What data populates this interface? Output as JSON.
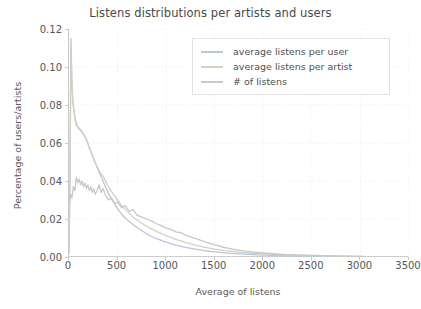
{
  "chart_data": {
    "type": "line",
    "title": "Listens distributions per artists and users",
    "xlabel": "Average of listens",
    "ylabel": "Percentage of users/artists",
    "xlim": [
      0,
      3500
    ],
    "ylim": [
      0.0,
      0.12
    ],
    "xticks": [
      0,
      500,
      1000,
      1500,
      2000,
      2500,
      3000,
      3500
    ],
    "xtick_labels": [
      "0",
      "500",
      "1000",
      "1500",
      "2000",
      "2500",
      "3000",
      "3500"
    ],
    "yticks": [
      0.0,
      0.02,
      0.04,
      0.06,
      0.08,
      0.1,
      0.12
    ],
    "ytick_labels": [
      "0.00",
      "0.02",
      "0.04",
      "0.06",
      "0.08",
      "0.10",
      "0.12"
    ],
    "grid": true,
    "grid_style": "dotted",
    "legend_position": "upper right",
    "series": [
      {
        "name": "average listens per user",
        "color": "#b9c6d8",
        "x": [
          0,
          10,
          20,
          30,
          40,
          55,
          70,
          85,
          100,
          120,
          140,
          160,
          180,
          200,
          230,
          260,
          290,
          320,
          350,
          400,
          450,
          500,
          550,
          600,
          650,
          700,
          750,
          800,
          850,
          900,
          1000,
          1100,
          1200,
          1300,
          1400,
          1500,
          1600,
          1700,
          1800,
          1900,
          2000,
          2200,
          2400,
          2600,
          2800,
          3000,
          3050
        ],
        "y": [
          0.002,
          0.04,
          0.115,
          0.092,
          0.082,
          0.076,
          0.071,
          0.069,
          0.068,
          0.067,
          0.0655,
          0.064,
          0.062,
          0.059,
          0.055,
          0.051,
          0.047,
          0.0435,
          0.04,
          0.034,
          0.0295,
          0.0255,
          0.022,
          0.0195,
          0.0175,
          0.0155,
          0.0138,
          0.0122,
          0.0108,
          0.0097,
          0.0078,
          0.0063,
          0.0051,
          0.0041,
          0.0033,
          0.0027,
          0.0022,
          0.0018,
          0.0015,
          0.0012,
          0.001,
          0.0007,
          0.0005,
          0.0004,
          0.0003,
          0.0002,
          0.0002
        ]
      },
      {
        "name": "average listens per artist",
        "color": "#cdd3c4",
        "x": [
          0,
          10,
          20,
          30,
          40,
          55,
          70,
          85,
          100,
          120,
          140,
          160,
          180,
          200,
          230,
          260,
          290,
          320,
          350,
          400,
          450,
          500,
          550,
          600,
          650,
          700,
          750,
          800,
          850,
          900,
          1000,
          1100,
          1200,
          1300,
          1400,
          1500,
          1600,
          1700,
          1800,
          1900,
          2000,
          2200,
          2400,
          2600,
          2800,
          3000,
          3050
        ],
        "y": [
          0.003,
          0.038,
          0.11,
          0.09,
          0.081,
          0.075,
          0.07,
          0.0685,
          0.0675,
          0.0665,
          0.065,
          0.0635,
          0.0615,
          0.0585,
          0.0545,
          0.0505,
          0.0475,
          0.0445,
          0.0425,
          0.0375,
          0.0335,
          0.03,
          0.0265,
          0.024,
          0.0215,
          0.0195,
          0.0178,
          0.0162,
          0.0148,
          0.0135,
          0.0112,
          0.0093,
          0.0077,
          0.0063,
          0.0051,
          0.0042,
          0.0034,
          0.0028,
          0.0023,
          0.0019,
          0.0016,
          0.0011,
          0.0008,
          0.0006,
          0.0004,
          0.0003,
          0.0002
        ]
      },
      {
        "name": "# of listens",
        "color": "#c8c8c8",
        "x": [
          0,
          15,
          30,
          45,
          60,
          75,
          90,
          105,
          120,
          135,
          150,
          165,
          180,
          195,
          210,
          225,
          240,
          255,
          270,
          290,
          310,
          330,
          350,
          380,
          410,
          440,
          470,
          500,
          540,
          580,
          620,
          660,
          700,
          750,
          800,
          850,
          900,
          950,
          1000,
          1050,
          1100,
          1150,
          1200,
          1300,
          1400,
          1500,
          1600,
          1700,
          1800,
          1900,
          2000,
          2200,
          2400,
          2600,
          2800,
          3000,
          3050
        ],
        "y": [
          0.028,
          0.033,
          0.031,
          0.037,
          0.035,
          0.042,
          0.039,
          0.041,
          0.038,
          0.04,
          0.037,
          0.039,
          0.036,
          0.038,
          0.035,
          0.037,
          0.034,
          0.036,
          0.033,
          0.035,
          0.038,
          0.034,
          0.036,
          0.032,
          0.03,
          0.031,
          0.028,
          0.029,
          0.026,
          0.027,
          0.024,
          0.025,
          0.022,
          0.021,
          0.02,
          0.019,
          0.0175,
          0.0165,
          0.0152,
          0.0145,
          0.0132,
          0.0128,
          0.0115,
          0.0098,
          0.008,
          0.0064,
          0.005,
          0.004,
          0.0032,
          0.0026,
          0.0021,
          0.0014,
          0.001,
          0.0007,
          0.0005,
          0.0003,
          0.0002
        ]
      }
    ]
  },
  "legend": {
    "items": [
      {
        "label": "average listens per user"
      },
      {
        "label": "average listens per artist"
      },
      {
        "label": "# of listens"
      }
    ]
  }
}
